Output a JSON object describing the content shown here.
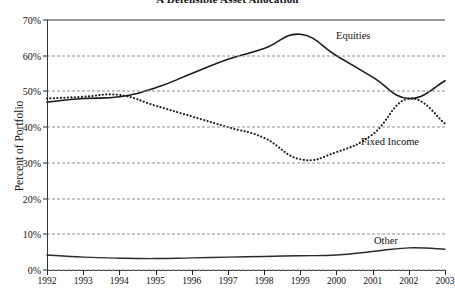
{
  "chart_data": {
    "type": "line",
    "title": "A Defensible Asset Allocation",
    "xlabel": "",
    "ylabel": "Percent of Portfolio",
    "x": [
      1992,
      1993,
      1994,
      1995,
      1996,
      1997,
      1998,
      1999,
      2000,
      2001,
      2002,
      2003
    ],
    "xtick_labels": [
      "1992",
      "1993",
      "1994",
      "1995",
      "1996",
      "1997",
      "1998",
      "1999",
      "2000",
      "2001",
      "2002",
      "2003"
    ],
    "ytick_labels": [
      "0%",
      "10%",
      "20%",
      "30%",
      "40%",
      "50%",
      "60%",
      "70%"
    ],
    "ytick_values": [
      0,
      10,
      20,
      30,
      40,
      50,
      60,
      70
    ],
    "ylim": [
      0,
      70
    ],
    "xlim": [
      1992,
      2003
    ],
    "grid": true,
    "legend_position": "inline-annotations",
    "series": [
      {
        "name": "Equities",
        "style": "solid",
        "color": "#1a1a1a",
        "values": [
          47,
          48,
          48.5,
          51,
          55,
          59,
          62,
          66,
          60,
          54,
          48,
          53
        ]
      },
      {
        "name": "Fixed Income",
        "style": "dotted",
        "color": "#1a1a1a",
        "values": [
          48,
          48.5,
          49,
          46,
          43,
          40,
          37,
          31,
          33,
          38,
          48,
          41
        ]
      },
      {
        "name": "Other",
        "style": "solid",
        "color": "#2a2a2a",
        "values": [
          4.2,
          3.6,
          3.3,
          3.2,
          3.4,
          3.6,
          3.8,
          4.0,
          4.2,
          5.2,
          6.2,
          5.8
        ]
      }
    ],
    "annotations": [
      {
        "text": "Equities",
        "x": 1999.6,
        "y": 62.5
      },
      {
        "text": "Fixed Income",
        "x": 2000.4,
        "y": 33.5
      },
      {
        "text": "Other",
        "x": 2001.9,
        "y": 10.0
      }
    ]
  }
}
